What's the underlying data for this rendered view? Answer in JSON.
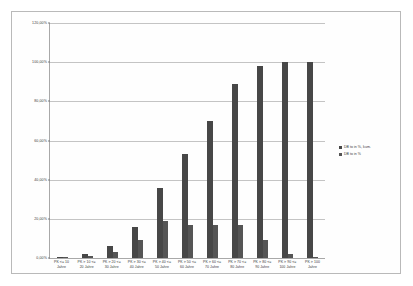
{
  "chart_data": {
    "type": "bar",
    "title": "",
    "xlabel": "",
    "ylabel": "",
    "ylim": [
      0,
      120
    ],
    "grid": true,
    "legend_position": "right",
    "ytick_labels": [
      "120,00%",
      "100,00%",
      "80,00%",
      "60,00%",
      "40,00%",
      "20,00%",
      "0,00%"
    ],
    "ytick_values": [
      120,
      100,
      80,
      60,
      40,
      20,
      0
    ],
    "categories": [
      "PK <= 10\nJahre",
      "PK > 10 <=\n20 Jahre",
      "PK > 20 <=\n30 Jahre",
      "PK > 30 <=\n40 Jahre",
      "PK > 40 <=\n50 Jahre",
      "PK > 50 <=\n60 Jahre",
      "PK > 60 <=\n70 Jahre",
      "PK > 70 <=\n80 Jahre",
      "PK > 80 <=\n90 Jahre",
      "PK > 90 <=\n100 Jahre",
      "PK > 100\nJahre"
    ],
    "series": [
      {
        "name": "DB to in %, kum.",
        "color": "#474747",
        "values": [
          0.5,
          2.0,
          6.0,
          16.0,
          36.0,
          53.0,
          70.0,
          89.0,
          98.0,
          100.0,
          100.0
        ]
      },
      {
        "name": "DB to in %",
        "color": "#555555",
        "values": [
          0.3,
          1.0,
          3.0,
          9.0,
          19.0,
          17.0,
          17.0,
          17.0,
          9.0,
          2.0,
          0.5
        ]
      }
    ]
  },
  "legend": {
    "entries": [
      {
        "label": "DB to in %, kum."
      },
      {
        "label": "DB to in %"
      }
    ]
  }
}
